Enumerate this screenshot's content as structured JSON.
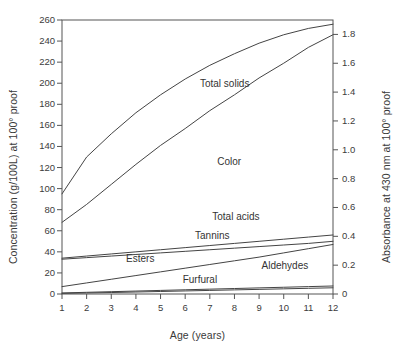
{
  "chart_data": {
    "type": "line",
    "title": "",
    "xlabel": "Age (years)",
    "ylabel": "Concentration (g/100L) at 100° proof",
    "y2label": "Absorbance at 430 nm at 100° proof",
    "xlim": [
      1,
      12
    ],
    "ylim": [
      0,
      260
    ],
    "y2lim": [
      0,
      1.9
    ],
    "grid": false,
    "legend": "inline-curve-labels",
    "x": [
      1,
      2,
      3,
      4,
      5,
      6,
      7,
      8,
      9,
      10,
      11,
      12
    ],
    "xticks": [
      "1",
      "2",
      "3",
      "4",
      "5",
      "6",
      "7",
      "8",
      "9",
      "10",
      "11",
      "12"
    ],
    "yticks": [
      "0",
      "20",
      "40",
      "60",
      "80",
      "100",
      "120",
      "140",
      "160",
      "180",
      "200",
      "220",
      "240",
      "260"
    ],
    "ytick_values": [
      0,
      20,
      40,
      60,
      80,
      100,
      120,
      140,
      160,
      180,
      200,
      220,
      240,
      260
    ],
    "y2ticks": [
      "0",
      "0.2",
      "0.4",
      "0.6",
      "0.8",
      "1.0",
      "1.2",
      "1.4",
      "1.6",
      "1.8"
    ],
    "y2tick_values": [
      0,
      0.2,
      0.4,
      0.6,
      0.8,
      1.0,
      1.2,
      1.4,
      1.6,
      1.8
    ],
    "series": [
      {
        "name": "Total solids",
        "axis": "left",
        "units": "g/100L",
        "values": [
          95,
          130,
          152,
          172,
          189,
          204,
          217,
          228,
          238,
          246,
          252,
          256
        ],
        "label_x": 6.6,
        "label_y": 198
      },
      {
        "name": "Color",
        "axis": "right",
        "units": "absorbance",
        "values": [
          0.5,
          0.62,
          0.76,
          0.9,
          1.03,
          1.15,
          1.27,
          1.38,
          1.5,
          1.6,
          1.71,
          1.8
        ],
        "values_left_scale": [
          68,
          85,
          104,
          123,
          141,
          157,
          174,
          189,
          205,
          219,
          234,
          246
        ],
        "label_x": 7.3,
        "label_y": 124
      },
      {
        "name": "Total acids",
        "axis": "left",
        "units": "g/100L",
        "values": [
          34,
          36,
          38,
          40,
          42,
          44,
          46,
          48,
          50,
          52,
          54,
          56
        ],
        "label_x": 7.1,
        "label_y": 72
      },
      {
        "name": "Tannins",
        "axis": "left",
        "units": "g/100L",
        "values": [
          33,
          34.5,
          36,
          37.5,
          39,
          40.5,
          42,
          43.5,
          45,
          46.5,
          48,
          50
        ],
        "label_x": 6.4,
        "label_y": 54
      },
      {
        "name": "Esters",
        "axis": "left",
        "units": "g/100L",
        "values": [
          7,
          10.5,
          14,
          17.5,
          21,
          24.5,
          28,
          31.5,
          35,
          39,
          43,
          47
        ],
        "label_x": 3.6,
        "label_y": 32
      },
      {
        "name": "Aldehydes",
        "axis": "left",
        "units": "g/100L",
        "values": [
          1.0,
          1.6,
          2.2,
          2.8,
          3.4,
          4.0,
          4.6,
          5.2,
          5.8,
          6.4,
          7.0,
          7.6
        ],
        "label_x": 9.1,
        "label_y": 26
      },
      {
        "name": "Furfural",
        "axis": "left",
        "units": "g/100L",
        "values": [
          0.6,
          1.0,
          1.4,
          1.9,
          2.4,
          2.9,
          3.4,
          3.9,
          4.4,
          4.9,
          5.4,
          5.9
        ],
        "label_x": 5.9,
        "label_y": 12
      }
    ]
  },
  "axes": {
    "x_title": "Age (years)",
    "y_left_title": "Concentration (g/100L) at 100° proof",
    "y_right_title": "Absorbance at 430 nm at 100° proof"
  },
  "colors": {
    "line": "#444444",
    "frame": "#555555",
    "text": "#3a3a3a",
    "background": "#ffffff"
  }
}
